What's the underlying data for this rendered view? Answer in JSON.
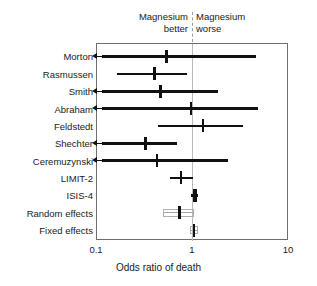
{
  "annotations": {
    "left_header": "Magnesium\nbetter",
    "right_header": "Magnesium\nworse"
  },
  "axis": {
    "title": "Odds ratio of death",
    "ticks": [
      "0.1",
      "1",
      "10"
    ]
  },
  "colors": {
    "line": "#111111",
    "summary_box": "#a8a8a8",
    "frame": "#6e6e6e",
    "reference_line": "#b9b9b9",
    "background": "#ffffff"
  },
  "chart_data": {
    "type": "forest",
    "title": "",
    "xlabel": "Odds ratio of death",
    "ylabel": "",
    "xscale": "log",
    "xlim": [
      0.1,
      10
    ],
    "xticks": [
      0.1,
      1,
      10
    ],
    "xticklabels": [
      "0.1",
      "1",
      "10"
    ],
    "reference_line": 1,
    "grid": false,
    "legend": "none",
    "categories": [
      "Morton",
      "Rasmussen",
      "Smith",
      "Abraham",
      "Feldstedt",
      "Shechter",
      "Ceremuzynski",
      "LIMIT-2",
      "ISIS-4",
      "Random effects",
      "Fixed effects"
    ],
    "points": [
      {
        "label": "Morton",
        "odds_ratio": 0.53,
        "ci_low": 0.08,
        "ci_high": 4.5,
        "left_truncated": true,
        "summary": false
      },
      {
        "label": "Rasmussen",
        "odds_ratio": 0.4,
        "ci_low": 0.16,
        "ci_high": 0.87,
        "left_truncated": false,
        "summary": false
      },
      {
        "label": "Smith",
        "odds_ratio": 0.46,
        "ci_low": 0.08,
        "ci_high": 1.83,
        "left_truncated": true,
        "summary": false
      },
      {
        "label": "Abraham",
        "odds_ratio": 0.95,
        "ci_low": 0.08,
        "ci_high": 4.7,
        "left_truncated": true,
        "summary": false
      },
      {
        "label": "Feldstedt",
        "odds_ratio": 1.27,
        "ci_low": 0.43,
        "ci_high": 3.3,
        "left_truncated": false,
        "summary": false
      },
      {
        "label": "Shechter",
        "odds_ratio": 0.32,
        "ci_low": 0.08,
        "ci_high": 0.68,
        "left_truncated": true,
        "summary": false
      },
      {
        "label": "Ceremuzynski",
        "odds_ratio": 0.42,
        "ci_low": 0.08,
        "ci_high": 2.3,
        "left_truncated": true,
        "summary": false
      },
      {
        "label": "LIMIT-2",
        "odds_ratio": 0.75,
        "ci_low": 0.57,
        "ci_high": 1.0,
        "left_truncated": false,
        "summary": false
      },
      {
        "label": "ISIS-4",
        "odds_ratio": 1.04,
        "ci_low": 0.95,
        "ci_high": 1.12,
        "left_truncated": false,
        "summary": false
      },
      {
        "label": "Random effects",
        "odds_ratio": 0.72,
        "ci_low": 0.49,
        "ci_high": 1.02,
        "left_truncated": false,
        "summary": true
      },
      {
        "label": "Fixed effects",
        "odds_ratio": 1.02,
        "ci_low": 0.92,
        "ci_high": 1.12,
        "left_truncated": false,
        "summary": true
      }
    ],
    "annotations": [
      {
        "text": "Magnesium better",
        "position": "top-left-of-reference"
      },
      {
        "text": "Magnesium worse",
        "position": "top-right-of-reference"
      }
    ]
  }
}
